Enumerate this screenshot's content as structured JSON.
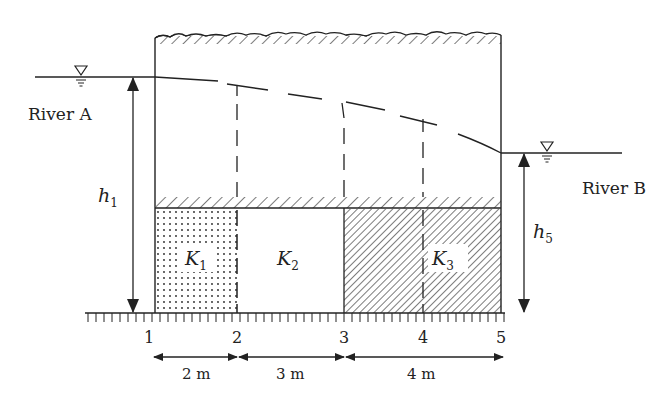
{
  "diagram": {
    "type": "groundwater-flow-cross-section",
    "rivers": {
      "left": {
        "label": "River A",
        "head_label": "h",
        "head_subscript": "1"
      },
      "right": {
        "label": "River B",
        "head_label": "h",
        "head_subscript": "5"
      }
    },
    "zones": [
      {
        "label": "K",
        "subscript": "1",
        "fill": "dotted",
        "from_section": "1",
        "to_section": "2",
        "width": "2 m"
      },
      {
        "label": "K",
        "subscript": "2",
        "fill": "blank",
        "from_section": "2",
        "to_section": "3",
        "width": "3 m"
      },
      {
        "label": "K",
        "subscript": "3",
        "fill": "hatched",
        "from_section": "3",
        "to_section": "5",
        "width": "4 m"
      }
    ],
    "sections": [
      "1",
      "2",
      "3",
      "4",
      "5"
    ],
    "dimensions": [
      "2 m",
      "3 m",
      "4 m"
    ],
    "water_table_symbol": "∇",
    "colors": {
      "ink": "#222222",
      "background": "#ffffff"
    }
  }
}
